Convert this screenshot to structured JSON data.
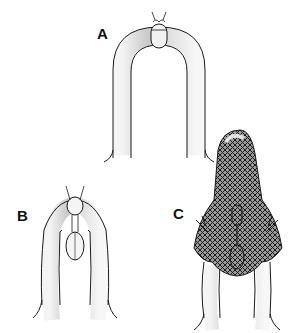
{
  "figure": {
    "panels": [
      {
        "label": "A",
        "description": "U-shaped tube with a small capsule and knotted suture at the apex"
      },
      {
        "label": "B",
        "description": "Inverted-V tube with two linked capsules in the cleft"
      },
      {
        "label": "C",
        "description": "Tube with capsules covered by a cross-hatched mesh sleeve extending upward"
      }
    ],
    "colors": {
      "ink": "#1a1a1a",
      "shade": "#bdbdbd",
      "mesh": "#2a2a2a",
      "background": "#ffffff"
    }
  }
}
